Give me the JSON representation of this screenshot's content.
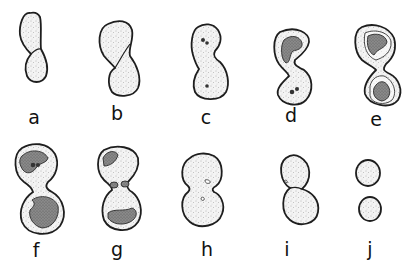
{
  "figure": {
    "panels": [
      {
        "id": "a",
        "label": "a",
        "description": "elongated cell beginning constriction"
      },
      {
        "id": "b",
        "label": "b",
        "description": "twisted cell with diagonal constriction"
      },
      {
        "id": "c",
        "label": "c",
        "description": "cell with two small inclusions in each lobe"
      },
      {
        "id": "d",
        "label": "d",
        "description": "S-shaped cell with darkened nuclear region and dots"
      },
      {
        "id": "e",
        "label": "e",
        "description": "S-shaped cell with dark inner masses in both lobes"
      },
      {
        "id": "f",
        "label": "f",
        "description": "figure-eight cell with large dark masses"
      },
      {
        "id": "g",
        "label": "g",
        "description": "figure-eight cell with scattered dark masses"
      },
      {
        "id": "h",
        "label": "h",
        "description": "two round lobes with small hollow inclusions"
      },
      {
        "id": "i",
        "label": "i",
        "description": "two lobes nearly separated"
      },
      {
        "id": "j",
        "label": "j",
        "description": "two separated round cells"
      }
    ],
    "caption": ""
  }
}
